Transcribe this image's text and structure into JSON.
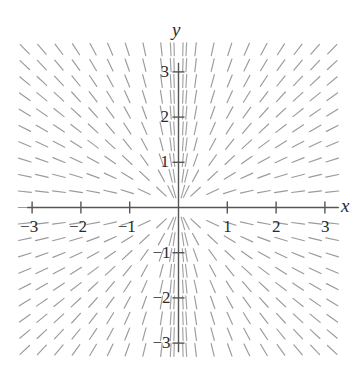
{
  "chart_data": {
    "type": "scatter",
    "subtype": "slope-field",
    "title": "",
    "xlabel": "x",
    "ylabel": "y",
    "xlim": [
      -3.3,
      3.3
    ],
    "ylim": [
      -3.35,
      3.35
    ],
    "grid": false,
    "legend": null,
    "equation": "dy/dx = y/x",
    "x_ticks": [
      -3,
      -2,
      -1,
      1,
      2,
      3
    ],
    "y_ticks": [
      -3,
      -2,
      -1,
      1,
      2,
      3
    ],
    "x_tick_labels": [
      "−3",
      "−2",
      "−1",
      "1",
      "2",
      "3"
    ],
    "y_tick_labels": [
      "−3",
      "−2",
      "−1",
      "1",
      "2",
      "3"
    ],
    "sample_step": 0.35,
    "segment_length_px": 13,
    "slope_color": "#8a8a8a",
    "axis_color": "#555555",
    "text_color": "#2b2b2b",
    "background": "#ffffff"
  },
  "axes": {
    "x_axis_label": "x",
    "y_axis_label": "y"
  },
  "ticks": {
    "x": [
      {
        "value": -3,
        "label": "−3"
      },
      {
        "value": -2,
        "label": "−2"
      },
      {
        "value": -1,
        "label": "−1"
      },
      {
        "value": 1,
        "label": "1"
      },
      {
        "value": 2,
        "label": "2"
      },
      {
        "value": 3,
        "label": "3"
      }
    ],
    "y": [
      {
        "value": 3,
        "label": "3"
      },
      {
        "value": 2,
        "label": "2"
      },
      {
        "value": 1,
        "label": "1"
      },
      {
        "value": -1,
        "label": "−1"
      },
      {
        "value": -2,
        "label": "−2"
      },
      {
        "value": -3,
        "label": "−3"
      }
    ]
  }
}
